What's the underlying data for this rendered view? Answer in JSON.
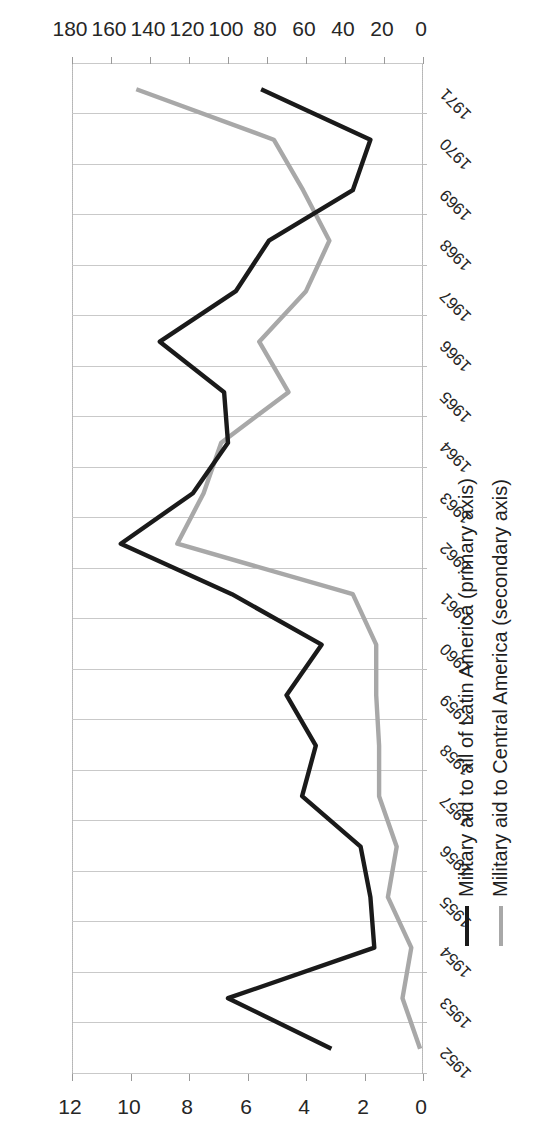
{
  "chart_data": {
    "type": "line",
    "title": "",
    "xlabel": "",
    "ylabel": "",
    "y2label": "",
    "grid": true,
    "legend_position": "bottom",
    "orientation_note": "chart rendered rotated 90 degrees counter-clockwise in the scan",
    "categories": [
      "1952",
      "1953",
      "1954",
      "1955",
      "1956",
      "1957",
      "1958",
      "1959",
      "1960",
      "1961",
      "1962",
      "1963",
      "1964",
      "1965",
      "1966",
      "1967",
      "1968",
      "1969",
      "1970",
      "1971"
    ],
    "axes": {
      "primary": {
        "label": "Military aid to all of Latin America",
        "ticks": [
          0,
          20,
          40,
          60,
          80,
          100,
          120,
          140,
          160,
          180
        ],
        "ylim": [
          0,
          180
        ],
        "position": "bottom"
      },
      "secondary": {
        "label": "Military aid to Central America",
        "ticks": [
          0,
          2,
          4,
          6,
          8,
          10,
          12
        ],
        "ylim": [
          0,
          12
        ],
        "position": "top"
      }
    },
    "series": [
      {
        "name": "Military aid to all of Latin America (primary axis)",
        "axis": "primary",
        "color": "#1a1a1a",
        "values": [
          47,
          100,
          25,
          27,
          32,
          62,
          55,
          70,
          52,
          98,
          155,
          118,
          100,
          102,
          135,
          96,
          79,
          36,
          27,
          83
        ]
      },
      {
        "name": "Military aid to Central America (secondary axis)",
        "axis": "secondary",
        "color": "#a8a8a8",
        "values": [
          0.1,
          0.7,
          0.4,
          1.2,
          0.9,
          1.5,
          1.5,
          1.6,
          1.6,
          2.4,
          8.4,
          7.5,
          6.9,
          4.6,
          5.6,
          4.0,
          3.2,
          4.1,
          5.1,
          9.8
        ]
      }
    ]
  },
  "legend": {
    "items": [
      {
        "label": "Military aid to all of Latin America (primary axis)",
        "color": "#1a1a1a",
        "style": "solid-black"
      },
      {
        "label": "Military aid to Central America (secondary axis)",
        "color": "#a8a8a8",
        "style": "solid-gray"
      }
    ]
  }
}
